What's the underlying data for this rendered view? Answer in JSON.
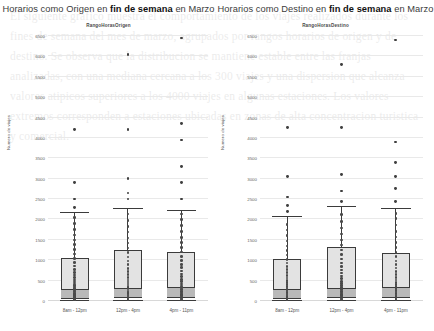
{
  "page": {
    "background_bleed_text": "El siguiente grafico muestra el comportamiento de los viajes realizados durante los fines de semana del mes de marzo, agrupados por rangos horarios de origen y de destino. Se observa que la distribucion se mantiene estable entre las franjas analizadas, con una mediana cercana a los 300 viajes y una dispersion que alcanza valores atipicos superiores a los 4000 viajes en algunas estaciones. Los valores extremos corresponden a estaciones ubicadas en zonas de alta concentracion turistica y comercial.",
    "accent_color": "#3b3b3b",
    "box_fill_color": "#e3e3e3",
    "median_band_color": "#b9b9b9",
    "point_color": "#4a4a4a",
    "grid_color": "#e9e9e9"
  },
  "charts": [
    {
      "id": "origen",
      "title_prefix": "Horarios como Origen en ",
      "title_strong": "fin de semana",
      "title_suffix": " en Marzo",
      "title_full": "Horarios como Origen en fin de semana en Marzo",
      "subtitle": "RangoHorasOrigen",
      "chart_data": {
        "type": "box",
        "title": "Horarios como Origen en fin de semana en Marzo",
        "subtitle": "RangoHorasOrigen",
        "xlabel": "RangoHorasOrigen",
        "ylabel": "Numero de viajes",
        "ylim": [
          0,
          6500
        ],
        "yticks": [
          0,
          500,
          1000,
          1500,
          2000,
          2500,
          3000,
          3500,
          4000,
          4500,
          5000,
          5500,
          6000,
          6500
        ],
        "ytick_labels": [
          "0",
          "500",
          "1000",
          "1500",
          "2000",
          "2500",
          "3000",
          "3500",
          "4000",
          "4500",
          "5000",
          "5500",
          "6000",
          "6500"
        ],
        "grid": true,
        "legend": "none",
        "categories": [
          "8am - 12pm",
          "12pm - 4pm",
          "4pm - 11pm"
        ],
        "boxes": [
          {
            "category": "8am - 12pm",
            "whisker_low": 10,
            "q1": 60,
            "median": 300,
            "q3": 1050,
            "whisker_high": 2150,
            "outliers": [
              2300,
              2500,
              2900,
              4200
            ],
            "points": [
              20,
              40,
              60,
              80,
              100,
              130,
              160,
              190,
              220,
              250,
              280,
              310,
              340,
              380,
              420,
              470,
              520,
              580,
              640,
              700,
              780,
              860,
              950,
              1040,
              1150,
              1260,
              1380,
              1500,
              1620,
              1760,
              1900,
              2050
            ]
          },
          {
            "category": "12pm - 4pm",
            "whisker_low": 10,
            "q1": 70,
            "median": 330,
            "q3": 1250,
            "whisker_high": 2250,
            "outliers": [
              2500,
              2650,
              3000,
              4200,
              6050
            ],
            "points": [
              20,
              45,
              70,
              95,
              120,
              150,
              180,
              215,
              250,
              290,
              330,
              370,
              415,
              465,
              520,
              580,
              650,
              720,
              800,
              890,
              980,
              1080,
              1190,
              1300,
              1420,
              1550,
              1690,
              1830,
              1980,
              2130
            ]
          },
          {
            "category": "4pm - 11pm",
            "whisker_low": 10,
            "q1": 75,
            "median": 340,
            "q3": 1200,
            "whisker_high": 2200,
            "outliers": [
              2500,
              2900,
              3300,
              3950,
              4350,
              6450
            ],
            "points": [
              20,
              45,
              70,
              100,
              130,
              165,
              200,
              240,
              280,
              325,
              370,
              420,
              475,
              530,
              595,
              660,
              735,
              815,
              900,
              995,
              1095,
              1200,
              1310,
              1430,
              1560,
              1700,
              1850,
              2000,
              2130
            ]
          }
        ]
      }
    },
    {
      "id": "destino",
      "title_prefix": "Horarios como Destino en ",
      "title_strong": "fin de semana",
      "title_suffix": " en Marzo",
      "title_full": "Horarios como Destino en fin de semana en Marzo",
      "subtitle": "RangoHorasDestino",
      "chart_data": {
        "type": "box",
        "title": "Horarios como Destino en fin de semana en Marzo",
        "subtitle": "RangoHorasDestino",
        "xlabel": "RangoHorasDestino",
        "ylabel": "Numero de viajes",
        "ylim": [
          0,
          6500
        ],
        "yticks": [
          0,
          500,
          1000,
          1500,
          2000,
          2500,
          3000,
          3500,
          4000,
          4500,
          5000,
          5500,
          6000,
          6500
        ],
        "ytick_labels": [
          "0",
          "500",
          "1000",
          "1500",
          "2000",
          "2500",
          "3000",
          "3500",
          "4000",
          "4500",
          "5000",
          "5500",
          "6000",
          "6500"
        ],
        "grid": true,
        "legend": "none",
        "categories": [
          "8am - 12pm",
          "12pm - 4pm",
          "4pm - 11pm"
        ],
        "boxes": [
          {
            "category": "8am - 12pm",
            "whisker_low": 10,
            "q1": 60,
            "median": 290,
            "q3": 1020,
            "whisker_high": 2050,
            "outliers": [
              2200,
              2350,
              2550,
              3050,
              4250
            ],
            "points": [
              20,
              40,
              65,
              90,
              115,
              145,
              175,
              210,
              245,
              280,
              315,
              355,
              400,
              450,
              505,
              560,
              625,
              695,
              770,
              850,
              935,
              1025,
              1125,
              1235,
              1350,
              1470,
              1600,
              1740,
              1880
            ]
          },
          {
            "category": "12pm - 4pm",
            "whisker_low": 10,
            "q1": 70,
            "median": 330,
            "q3": 1320,
            "whisker_high": 2300,
            "outliers": [
              2450,
              2700,
              3100,
              4250,
              5800
            ],
            "points": [
              20,
              45,
              70,
              100,
              130,
              165,
              200,
              240,
              285,
              330,
              375,
              430,
              485,
              545,
              610,
              685,
              760,
              845,
              935,
              1035,
              1140,
              1250,
              1370,
              1500,
              1640,
              1790,
              1950,
              2120
            ]
          },
          {
            "category": "4pm - 11pm",
            "whisker_low": 10,
            "q1": 80,
            "median": 345,
            "q3": 1180,
            "whisker_high": 2250,
            "outliers": [
              2450,
              2750,
              3050,
              3400,
              3900,
              6400
            ],
            "points": [
              20,
              50,
              80,
              110,
              145,
              180,
              220,
              260,
              305,
              350,
              400,
              455,
              515,
              580,
              650,
              725,
              805,
              890,
              985,
              1085,
              1195,
              1310,
              1435,
              1570,
              1710,
              1860,
              2020,
              2150
            ]
          }
        ]
      }
    }
  ]
}
